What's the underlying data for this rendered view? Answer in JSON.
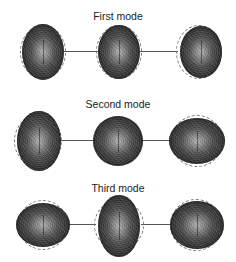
{
  "figure": {
    "rows": [
      {
        "title": "First mode",
        "shapes": [
          {
            "label": "negative deviation",
            "aspect": "tall oval"
          },
          {
            "label": "mean shape",
            "aspect": "tall oval"
          },
          {
            "label": "positive deviation",
            "aspect": "tall oval"
          }
        ]
      },
      {
        "title": "Second mode",
        "shapes": [
          {
            "label": "negative deviation",
            "aspect": "tall oval"
          },
          {
            "label": "mean shape",
            "aspect": "round"
          },
          {
            "label": "positive deviation",
            "aspect": "wide oval"
          }
        ]
      },
      {
        "title": "Third mode",
        "shapes": [
          {
            "label": "negative deviation",
            "aspect": "wide oval"
          },
          {
            "label": "mean shape",
            "aspect": "tall oval"
          },
          {
            "label": "positive deviation",
            "aspect": "wide oval"
          }
        ]
      }
    ],
    "colors": {
      "background": "#ffffff",
      "shape_fill": "#3a3a3a",
      "outline_dashed": "#777777",
      "connector": "#555555",
      "text": "#222222"
    }
  }
}
